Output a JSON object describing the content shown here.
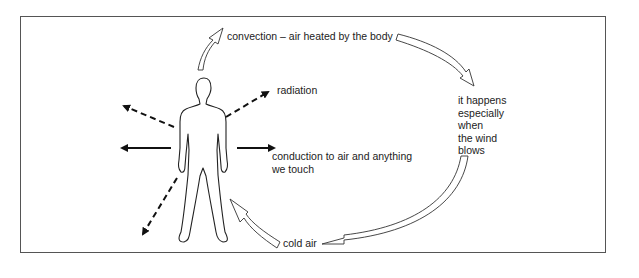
{
  "diagram": {
    "labels": {
      "convection": "convection – air heated by the body",
      "radiation": "radiation",
      "conduction_line1": "conduction to air and anything",
      "conduction_line2": "we touch",
      "wind_lines": [
        "it happens",
        "especially",
        "when",
        "the wind",
        "blows"
      ],
      "cold_air": "cold air"
    },
    "elements": {
      "figure": "human-body-outline",
      "arrows": [
        {
          "type": "dashed",
          "direction": "up-right",
          "meaning": "radiation"
        },
        {
          "type": "dashed",
          "direction": "up-left",
          "meaning": "radiation"
        },
        {
          "type": "dashed",
          "direction": "down-left",
          "meaning": "radiation"
        },
        {
          "type": "solid",
          "direction": "left",
          "meaning": "conduction"
        },
        {
          "type": "solid",
          "direction": "right",
          "meaning": "conduction"
        },
        {
          "type": "hollow-curved",
          "direction": "up",
          "meaning": "convection rising"
        },
        {
          "type": "hollow-curved",
          "direction": "clockwise-loop",
          "meaning": "wind circulation"
        },
        {
          "type": "hollow-curved",
          "direction": "toward-body",
          "meaning": "cold air"
        }
      ]
    }
  }
}
